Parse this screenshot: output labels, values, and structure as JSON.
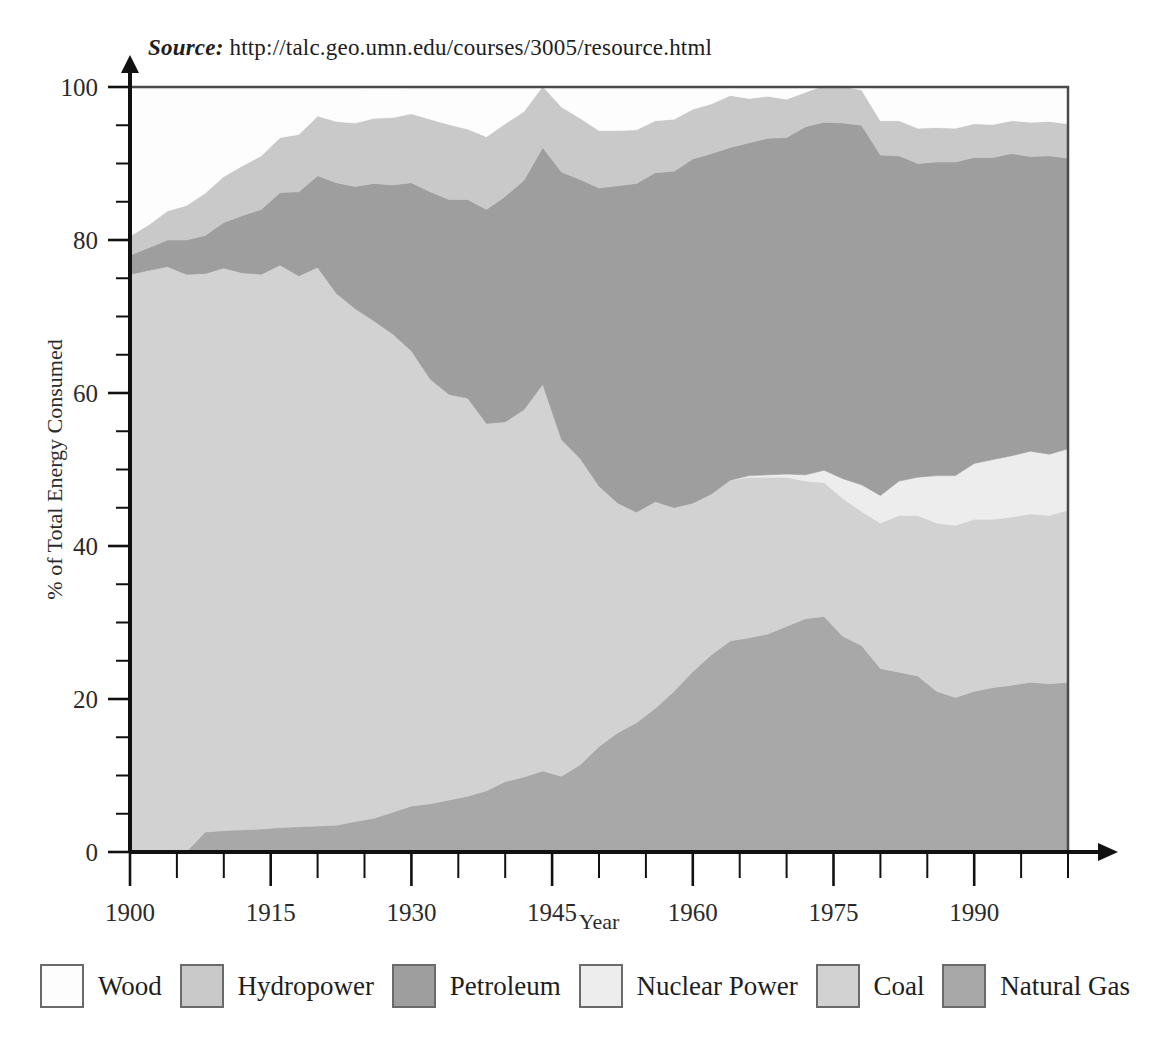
{
  "source": {
    "label": "Source:",
    "url": "http://talc.geo.umn.edu/courses/3005/resource.html"
  },
  "axes": {
    "y_title": "% of Total Energy Consumed",
    "x_title": "Year",
    "y_ticks": [
      "0",
      "20",
      "40",
      "60",
      "80",
      "100"
    ],
    "x_ticks": [
      "1900",
      "1915",
      "1930",
      "1945",
      "1960",
      "1975",
      "1990"
    ]
  },
  "legend": {
    "items": [
      {
        "label": "Wood",
        "color": "#fdfdfd"
      },
      {
        "label": "Hydropower",
        "color": "#c9c9c9"
      },
      {
        "label": "Petroleum",
        "color": "#9e9e9e"
      },
      {
        "label": "Nuclear Power",
        "color": "#ededed"
      },
      {
        "label": "Coal",
        "color": "#d2d2d2"
      },
      {
        "label": "Natural Gas",
        "color": "#a8a8a8"
      }
    ]
  },
  "chart_data": {
    "type": "area",
    "title": "",
    "subtitle": "",
    "xlabel": "Year",
    "ylabel": "% of Total Energy Consumed",
    "xlim": [
      1900,
      2000
    ],
    "ylim": [
      0,
      100
    ],
    "grid": false,
    "stacked": true,
    "legend_position": "bottom",
    "axis_ticks": {
      "x_major": [
        1900,
        1915,
        1930,
        1945,
        1960,
        1975,
        1990
      ],
      "x_minor_step": 5,
      "y_major": [
        0,
        20,
        40,
        60,
        80,
        100
      ],
      "y_minor_step": 5
    },
    "stack_order_bottom_to_top": [
      "Natural Gas",
      "Coal",
      "Nuclear Power",
      "Petroleum",
      "Hydropower",
      "Wood"
    ],
    "x": [
      1900,
      1902,
      1904,
      1906,
      1908,
      1910,
      1912,
      1914,
      1916,
      1918,
      1920,
      1922,
      1924,
      1926,
      1928,
      1930,
      1932,
      1934,
      1936,
      1938,
      1940,
      1942,
      1944,
      1946,
      1948,
      1950,
      1952,
      1954,
      1956,
      1958,
      1960,
      1962,
      1964,
      1966,
      1968,
      1970,
      1972,
      1974,
      1976,
      1978,
      1980,
      1982,
      1984,
      1986,
      1988,
      1990,
      1992,
      1994,
      1996,
      1998,
      2000
    ],
    "series": [
      {
        "name": "Natural Gas",
        "color": "#a8a8a8",
        "values": [
          0,
          0,
          0,
          0,
          2.6,
          2.8,
          2.9,
          3.0,
          3.2,
          3.3,
          3.4,
          3.5,
          4.0,
          4.4,
          5.2,
          6.0,
          6.3,
          6.8,
          7.3,
          8.0,
          9.2,
          9.8,
          10.6,
          9.9,
          11.4,
          13.8,
          15.6,
          16.9,
          18.8,
          21.0,
          23.6,
          25.8,
          27.6,
          28.0,
          28.5,
          29.5,
          30.5,
          30.8,
          28.2,
          27.0,
          24.0,
          23.5,
          23.0,
          21.0,
          20.2,
          21.0,
          21.5,
          21.8,
          22.2,
          22.0,
          22.2
        ]
      },
      {
        "name": "Coal",
        "color": "#d2d2d2",
        "values": [
          75.5,
          76.0,
          76.5,
          75.5,
          73.0,
          73.5,
          72.8,
          72.5,
          73.5,
          72.0,
          73.0,
          69.5,
          67.0,
          65.0,
          62.5,
          59.5,
          55.5,
          53.0,
          52.0,
          48.0,
          47.0,
          48.0,
          50.5,
          44.0,
          40.0,
          34.0,
          30.0,
          27.5,
          27.0,
          24.0,
          22.0,
          21.0,
          21.0,
          21.0,
          20.5,
          19.5,
          18.0,
          17.5,
          18.0,
          17.5,
          19.0,
          20.5,
          21.0,
          22.0,
          22.5,
          22.5,
          22.0,
          22.0,
          22.0,
          22.0,
          22.5
        ]
      },
      {
        "name": "Nuclear Power",
        "color": "#ededed",
        "values": [
          0,
          0,
          0,
          0,
          0,
          0,
          0,
          0,
          0,
          0,
          0,
          0,
          0,
          0,
          0,
          0,
          0,
          0,
          0,
          0,
          0,
          0,
          0,
          0,
          0,
          0,
          0,
          0,
          0,
          0,
          0,
          0,
          0,
          0.2,
          0.3,
          0.4,
          0.8,
          1.6,
          2.6,
          3.5,
          3.6,
          4.5,
          5.0,
          6.2,
          6.5,
          7.3,
          7.8,
          8.0,
          8.2,
          8.0,
          8.0
        ]
      },
      {
        "name": "Petroleum",
        "color": "#9e9e9e",
        "values": [
          2.5,
          3.0,
          3.5,
          4.5,
          5.0,
          6.0,
          7.5,
          8.5,
          9.5,
          11.0,
          12.0,
          14.5,
          16.0,
          18.0,
          19.5,
          22.0,
          24.5,
          25.5,
          26.0,
          28.0,
          29.5,
          30.0,
          31.0,
          35.0,
          36.5,
          39.0,
          41.5,
          43.0,
          43.0,
          44.0,
          45.0,
          44.5,
          43.5,
          43.5,
          44.0,
          44.0,
          45.5,
          45.5,
          46.5,
          47.0,
          44.5,
          42.5,
          41.0,
          41.0,
          41.0,
          40.0,
          39.5,
          39.5,
          38.5,
          39.0,
          38.0
        ]
      },
      {
        "name": "Hydropower",
        "color": "#c9c9c9",
        "values": [
          2.5,
          3.0,
          3.8,
          4.5,
          5.5,
          6.0,
          6.5,
          7.0,
          7.2,
          7.5,
          7.8,
          8.0,
          8.3,
          8.5,
          8.8,
          9.0,
          9.5,
          9.8,
          9.2,
          9.5,
          9.5,
          9.0,
          8.0,
          8.5,
          8.0,
          7.5,
          7.2,
          7.0,
          6.8,
          6.8,
          6.5,
          6.5,
          6.8,
          5.8,
          5.5,
          5.0,
          4.5,
          4.8,
          4.8,
          4.6,
          4.5,
          4.6,
          4.6,
          4.5,
          4.4,
          4.4,
          4.3,
          4.3,
          4.5,
          4.5,
          4.5
        ]
      },
      {
        "name": "Wood",
        "color": "#fdfdfd",
        "values": [
          19.5,
          18.0,
          16.2,
          15.5,
          13.9,
          11.7,
          10.3,
          9.0,
          6.6,
          6.2,
          3.8,
          4.5,
          4.7,
          3.6,
          3.5,
          3.5,
          4.2,
          4.9,
          5.5,
          6.5,
          4.8,
          3.2,
          0.0,
          2.6,
          4.1,
          5.7,
          5.7,
          5.6,
          4.4,
          4.2,
          2.9,
          2.2,
          1.1,
          1.5,
          1.2,
          1.6,
          0.7,
          0.0,
          0.0,
          0.4,
          4.4,
          4.4,
          5.4,
          5.3,
          5.4,
          4.8,
          4.9,
          4.4,
          4.6,
          4.5,
          4.8
        ]
      }
    ]
  }
}
